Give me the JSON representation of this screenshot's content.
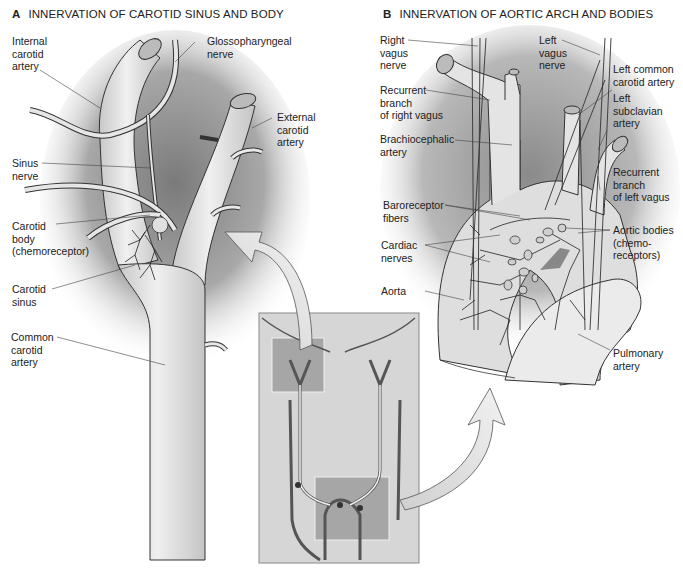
{
  "panel_a": {
    "letter": "A",
    "title": "INNERVATION OF CAROTID SINUS AND BODY",
    "labels": {
      "internal_carotid_artery": "Internal\ncarotid\nartery",
      "glossopharyngeal_nerve": "Glossopharyngeal\nnerve",
      "external_carotid_artery": "External\ncarotid\nartery",
      "sinus_nerve": "Sinus\nnerve",
      "carotid_body": "Carotid\nbody\n(chemoreceptor)",
      "carotid_sinus": "Carotid\nsinus",
      "common_carotid_artery": "Common\ncarotid\nartery"
    }
  },
  "panel_b": {
    "letter": "B",
    "title": "INNERVATION OF AORTIC ARCH AND BODIES",
    "labels": {
      "right_vagus_nerve": "Right\nvagus\nnerve",
      "left_vagus_nerve": "Left\nvagus\nnerve",
      "left_common_carotid_artery": "Left common\ncarotid artery",
      "left_subclavian_artery": "Left\nsubclavian\nartery",
      "recurrent_branch_right_vagus": "Recurrent\nbranch\nof right vagus",
      "brachiocephalic_artery": "Brachiocephalic\nartery",
      "recurrent_branch_left_vagus": "Recurrent\nbranch\nof left vagus",
      "baroreceptor_fibers": "Baroreceptor\nfibers",
      "aortic_bodies": "Aortic bodies\n(chemo-\nreceptors)",
      "cardiac_nerves": "Cardiac\nnerves",
      "aorta": "Aorta",
      "pulmonary_artery": "Pulmonary\nartery"
    }
  },
  "colors": {
    "vessel_fill": "#dcdcdc",
    "vessel_stroke": "#3a3a3a",
    "shadow": "#8a8a8a",
    "inset_bg": "#d4d4d4",
    "highlight_box": "#a8a8a8",
    "arrow_fill": "#e6e6e6"
  }
}
